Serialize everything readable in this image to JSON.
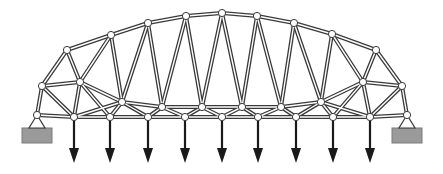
{
  "diagram": {
    "title": "",
    "colors": {
      "member": "#3a3a3a",
      "node_fill": "#ffffff",
      "support_block": "#9a9a9a",
      "load": "#1a1a1a"
    },
    "nodes": {
      "L0": [
        37,
        115
      ],
      "L1": [
        74,
        117
      ],
      "L2": [
        110,
        117
      ],
      "L3": [
        148,
        117
      ],
      "L4": [
        185,
        117
      ],
      "L5": [
        222,
        117
      ],
      "L6": [
        258,
        117
      ],
      "L7": [
        296,
        117
      ],
      "L8": [
        333,
        117
      ],
      "L9": [
        370,
        117
      ],
      "L10": [
        407,
        115
      ],
      "M1": [
        42,
        86
      ],
      "M2": [
        80,
        82
      ],
      "M3": [
        122,
        102
      ],
      "M4": [
        162,
        107
      ],
      "M5": [
        202,
        107
      ],
      "M6": [
        242,
        107
      ],
      "M7": [
        281,
        107
      ],
      "M8": [
        321,
        102
      ],
      "M9": [
        363,
        82
      ],
      "M10": [
        402,
        86
      ],
      "U1": [
        67,
        50
      ],
      "U2": [
        111,
        35
      ],
      "U3": [
        148,
        23
      ],
      "U4": [
        186,
        16
      ],
      "U5": [
        222,
        13
      ],
      "U6": [
        257,
        16
      ],
      "U7": [
        294,
        23
      ],
      "U8": [
        332,
        34
      ],
      "U9": [
        376,
        50
      ]
    },
    "members": [
      [
        "L0",
        "L1"
      ],
      [
        "L1",
        "L2"
      ],
      [
        "L2",
        "L3"
      ],
      [
        "L3",
        "L4"
      ],
      [
        "L4",
        "L5"
      ],
      [
        "L5",
        "L6"
      ],
      [
        "L6",
        "L7"
      ],
      [
        "L7",
        "L8"
      ],
      [
        "L8",
        "L9"
      ],
      [
        "L9",
        "L10"
      ],
      [
        "L0",
        "M1"
      ],
      [
        "M1",
        "U1"
      ],
      [
        "U1",
        "U2"
      ],
      [
        "U2",
        "U3"
      ],
      [
        "U3",
        "U4"
      ],
      [
        "U4",
        "U5"
      ],
      [
        "U5",
        "U6"
      ],
      [
        "U6",
        "U7"
      ],
      [
        "U7",
        "U8"
      ],
      [
        "U8",
        "U9"
      ],
      [
        "U9",
        "M10"
      ],
      [
        "M10",
        "L10"
      ],
      [
        "M1",
        "M2"
      ],
      [
        "M1",
        "L1"
      ],
      [
        "M2",
        "L1"
      ],
      [
        "U1",
        "M2"
      ],
      [
        "M2",
        "U2"
      ],
      [
        "M2",
        "M3"
      ],
      [
        "M3",
        "L1"
      ],
      [
        "M3",
        "L2"
      ],
      [
        "M3",
        "L3"
      ],
      [
        "M2",
        "L2"
      ],
      [
        "U2",
        "M3"
      ],
      [
        "U3",
        "M3"
      ],
      [
        "M3",
        "M4"
      ],
      [
        "M4",
        "M5"
      ],
      [
        "M5",
        "M6"
      ],
      [
        "M6",
        "M7"
      ],
      [
        "M7",
        "M8"
      ],
      [
        "M4",
        "L3"
      ],
      [
        "M4",
        "L4"
      ],
      [
        "M5",
        "L4"
      ],
      [
        "M5",
        "L5"
      ],
      [
        "M6",
        "L5"
      ],
      [
        "M6",
        "L6"
      ],
      [
        "M7",
        "L6"
      ],
      [
        "M7",
        "L7"
      ],
      [
        "M8",
        "L7"
      ],
      [
        "M8",
        "L8"
      ],
      [
        "M8",
        "L9"
      ],
      [
        "U3",
        "M4"
      ],
      [
        "M4",
        "U4"
      ],
      [
        "U4",
        "M5"
      ],
      [
        "M5",
        "U5"
      ],
      [
        "U5",
        "M6"
      ],
      [
        "M6",
        "U6"
      ],
      [
        "U6",
        "M7"
      ],
      [
        "M7",
        "U7"
      ],
      [
        "U7",
        "M8"
      ],
      [
        "U8",
        "M8"
      ],
      [
        "M8",
        "M9"
      ],
      [
        "M9",
        "L8"
      ],
      [
        "M9",
        "L9"
      ],
      [
        "M9",
        "U8"
      ],
      [
        "M9",
        "U9"
      ],
      [
        "M9",
        "M10"
      ],
      [
        "M10",
        "L9"
      ]
    ],
    "supports": [
      "L0",
      "L10"
    ],
    "loads": [
      "L1",
      "L2",
      "L3",
      "L4",
      "L5",
      "L6",
      "L7",
      "L8",
      "L9"
    ],
    "load_direction": "down"
  }
}
